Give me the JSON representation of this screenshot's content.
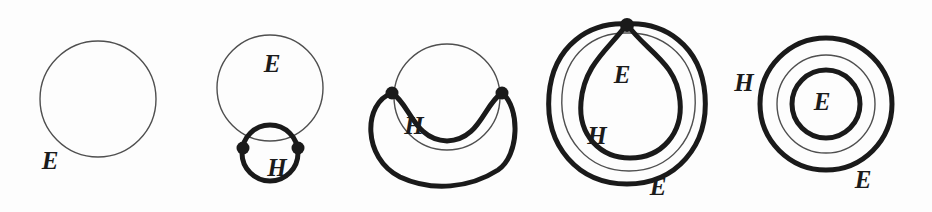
{
  "figure": {
    "name": "surface-curve-sequence",
    "background_color": "#fdfdfd",
    "thick_stroke_color": "#1a1a1a",
    "thin_stroke_color": "#4f4f4f",
    "vertex_color": "#1a1a1a",
    "thick_stroke_width": 5,
    "thin_stroke_width": 1.4,
    "panels": [
      {
        "id": "panel-1",
        "index": 1,
        "vertex_count": 0,
        "labels": [
          {
            "text": "E",
            "x": 50,
            "y": 163
          }
        ]
      },
      {
        "id": "panel-2",
        "index": 2,
        "vertex_count": 2,
        "labels": [
          {
            "text": "E",
            "x": 272,
            "y": 66
          },
          {
            "text": "H",
            "x": 277,
            "y": 170
          }
        ]
      },
      {
        "id": "panel-3",
        "index": 3,
        "vertex_count": 2,
        "labels": [
          {
            "text": "H",
            "x": 414,
            "y": 128
          }
        ]
      },
      {
        "id": "panel-4",
        "index": 4,
        "vertex_count": 1,
        "labels": [
          {
            "text": "E",
            "x": 622,
            "y": 77
          },
          {
            "text": "H",
            "x": 597,
            "y": 138
          },
          {
            "text": "E",
            "x": 658,
            "y": 189
          }
        ]
      },
      {
        "id": "panel-5",
        "index": 5,
        "vertex_count": 0,
        "labels": [
          {
            "text": "H",
            "x": 744,
            "y": 85
          },
          {
            "text": "E",
            "x": 822,
            "y": 104
          },
          {
            "text": "E",
            "x": 863,
            "y": 182
          }
        ]
      }
    ]
  }
}
